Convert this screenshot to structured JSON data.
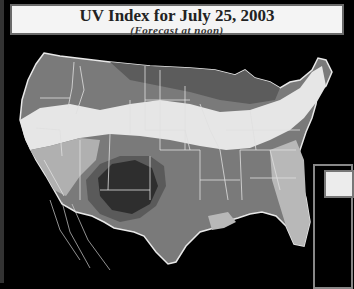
{
  "header": {
    "title": "UV Index for July 25, 2003",
    "subtitle": "(Forecast at noon)"
  },
  "map": {
    "region": "Contiguous United States",
    "style": "grayscale",
    "zones": [
      {
        "name": "darkest-southwest",
        "shade": "#2e2e2e"
      },
      {
        "name": "dark",
        "shade": "#5a5a5a"
      },
      {
        "name": "medium",
        "shade": "#808080"
      },
      {
        "name": "light",
        "shade": "#a8a8a8"
      },
      {
        "name": "lightest-band",
        "shade": "#e8e8e8"
      }
    ],
    "colors": {
      "background": "#000000",
      "borders": "#e0e0e0"
    }
  }
}
